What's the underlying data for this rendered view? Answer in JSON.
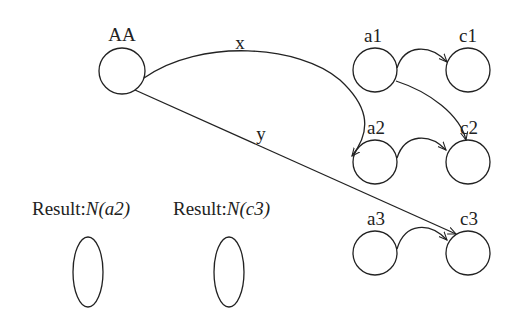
{
  "diagram": {
    "nodes": [
      {
        "id": "AA",
        "label": "AA",
        "cx": 122,
        "cy": 71,
        "r": 23,
        "lx": 122,
        "ly": 40
      },
      {
        "id": "a1",
        "label": "a1",
        "cx": 375,
        "cy": 70,
        "r": 22,
        "lx": 372,
        "ly": 40
      },
      {
        "id": "c1",
        "label": "c1",
        "cx": 468,
        "cy": 70,
        "r": 22,
        "lx": 468,
        "ly": 40
      },
      {
        "id": "a2",
        "label": "a2",
        "cx": 375,
        "cy": 162,
        "r": 22,
        "lx": 375,
        "ly": 131
      },
      {
        "id": "c2",
        "label": "c2",
        "cx": 468,
        "cy": 162,
        "r": 22,
        "lx": 468,
        "ly": 131
      },
      {
        "id": "a3",
        "label": "a3",
        "cx": 375,
        "cy": 253,
        "r": 22,
        "lx": 375,
        "ly": 222
      },
      {
        "id": "c3",
        "label": "c3",
        "cx": 468,
        "cy": 253,
        "r": 22,
        "lx": 468,
        "ly": 222
      }
    ],
    "edges": [
      {
        "from": "AA",
        "to": "a2",
        "label": "x",
        "lx": 240,
        "ly": 48
      },
      {
        "from": "AA",
        "to": "c3",
        "label": "y",
        "lx": 260,
        "ly": 140
      },
      {
        "from": "a1",
        "to": "c1",
        "label": ""
      },
      {
        "from": "a1",
        "to": "c2",
        "label": ""
      },
      {
        "from": "a2",
        "to": "c2",
        "label": ""
      },
      {
        "from": "a3",
        "to": "c3",
        "label": ""
      }
    ],
    "results": [
      {
        "prefix": "Result:",
        "value": "N(a2)"
      },
      {
        "prefix": "Result:",
        "value": "N(c3)"
      }
    ]
  }
}
